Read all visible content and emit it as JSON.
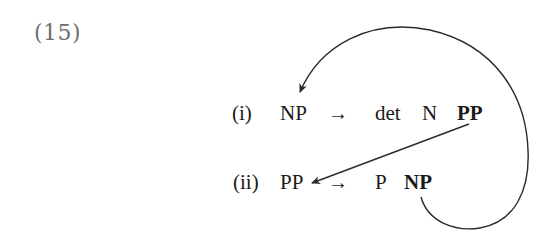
{
  "example_number": "(15)",
  "rules": [
    {
      "label": "(i)",
      "lhs": "NP",
      "arrow": "→",
      "rhs": [
        {
          "text": "det",
          "bold": false
        },
        {
          "text": "N",
          "bold": false
        },
        {
          "text": "PP",
          "bold": true
        }
      ]
    },
    {
      "label": "(ii)",
      "lhs": "PP",
      "arrow": "→",
      "rhs": [
        {
          "text": "P",
          "bold": false
        },
        {
          "text": "NP",
          "bold": true
        }
      ]
    }
  ],
  "links": [
    {
      "from": "rule (i) rhs PP",
      "to": "rule (ii) lhs PP"
    },
    {
      "from": "rule (ii) rhs NP",
      "to": "rule (i) lhs NP"
    }
  ],
  "colors": {
    "text": "#1a1a1a",
    "example_number": "#6f6f6f",
    "line": "#2a2a2a"
  }
}
